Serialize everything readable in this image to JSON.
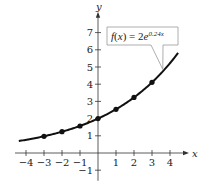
{
  "chart_data": {
    "type": "line",
    "title": "",
    "function_label": "f(x) = 2e^{0.24x}",
    "function_label_parts": {
      "lhs": "f(x) = 2e",
      "exponent": "0.24x"
    },
    "xlabel": "x",
    "ylabel": "y",
    "xlim": [
      -4.5,
      4.5
    ],
    "ylim": [
      -1.5,
      7.8
    ],
    "x_ticks": [
      -4,
      -3,
      -2,
      -1,
      1,
      2,
      3,
      4
    ],
    "y_ticks": [
      -1,
      1,
      2,
      3,
      4,
      5,
      6,
      7
    ],
    "x_tick_labels": [
      "−4",
      "−3",
      "−2",
      "−1",
      "1",
      "2",
      "3",
      "4"
    ],
    "y_tick_labels": [
      "−1",
      "1",
      "2",
      "3",
      "4",
      "5",
      "6",
      "7"
    ],
    "grid": false,
    "legend": "callout box pointing to curve near x≈3.6",
    "series": [
      {
        "name": "f(x) = 2e^(0.24x)",
        "curve": {
          "a": 2,
          "k": 0.24,
          "x_range": [
            -4.4,
            4.45
          ]
        },
        "points": [
          {
            "x": -3,
            "y": 0.97
          },
          {
            "x": -2,
            "y": 1.24
          },
          {
            "x": -1,
            "y": 1.57
          },
          {
            "x": 0,
            "y": 2.0
          },
          {
            "x": 1,
            "y": 2.54
          },
          {
            "x": 2,
            "y": 3.23
          },
          {
            "x": 3,
            "y": 4.11
          }
        ]
      }
    ]
  }
}
